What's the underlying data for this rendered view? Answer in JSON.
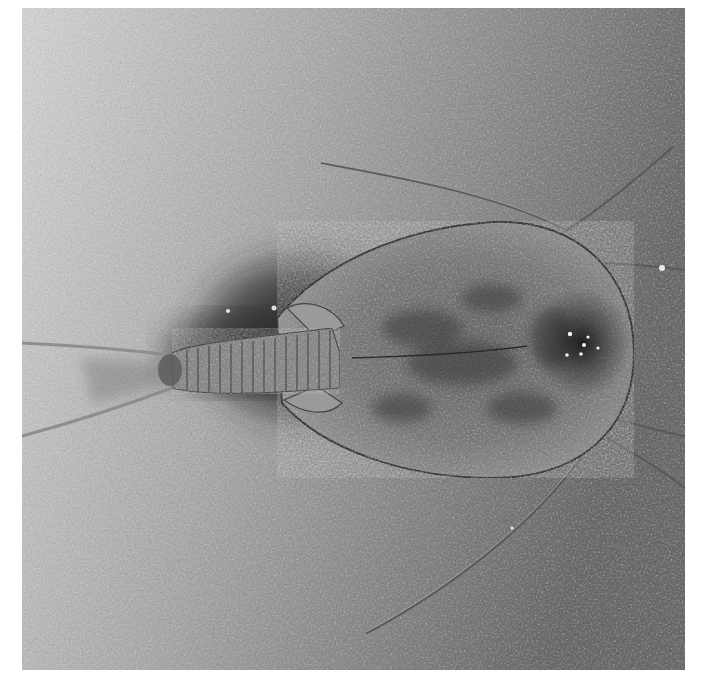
{
  "image": {
    "subject": "Tadpole shrimp (Triops) viewed from above on a textured surface",
    "style": "grayscale photograph",
    "colors": {
      "background_light": "#c9c9c9",
      "background_dark": "#6e6e6e",
      "carapace": "#8a8a8a",
      "carapace_dark": "#3c3c3c",
      "shadow": "#1e1e1e",
      "frame": "#ffffff"
    }
  }
}
